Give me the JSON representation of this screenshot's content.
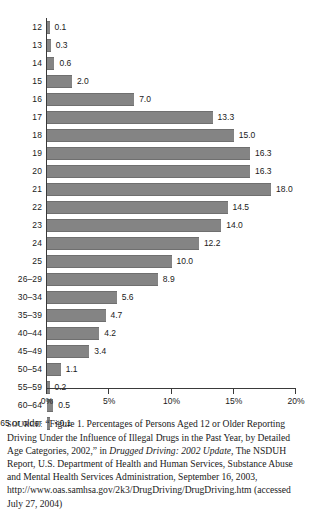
{
  "chart_data": {
    "type": "bar",
    "orientation": "horizontal",
    "title": "",
    "xlabel": "",
    "ylabel": "",
    "xlim": [
      0,
      20
    ],
    "grid": false,
    "legend": false,
    "axis_tick_labels": [
      "0%",
      "5%",
      "10%",
      "15%",
      "20%"
    ],
    "axis_tick_values": [
      0,
      5,
      10,
      15,
      20
    ],
    "categories": [
      "12",
      "13",
      "14",
      "15",
      "16",
      "17",
      "18",
      "19",
      "20",
      "21",
      "22",
      "23",
      "24",
      "25",
      "26–29",
      "30–34",
      "35–39",
      "40–44",
      "45–49",
      "50–54",
      "55–59",
      "60–64",
      "65 or older"
    ],
    "values": [
      0.1,
      0.3,
      0.6,
      2.0,
      7.0,
      13.3,
      15.0,
      16.3,
      16.3,
      18.0,
      14.5,
      14.0,
      12.2,
      10.0,
      8.9,
      5.6,
      4.7,
      4.2,
      3.4,
      1.1,
      0.2,
      0.5,
      0.1
    ],
    "value_labels": [
      "0.1",
      "0.3",
      "0.6",
      "2.0",
      "7.0",
      "13.3",
      "15.0",
      "16.3",
      "16.3",
      "18.0",
      "14.5",
      "14.0",
      "12.2",
      "10.0",
      "8.9",
      "5.6",
      "4.7",
      "4.2",
      "3.4",
      "1.1",
      "0.2",
      "0.5",
      "<0.1"
    ],
    "bar_color": "#848484"
  },
  "source": {
    "label": "SOURCE:",
    "line1": "“Figure 1. Percentages of Persons Aged 12 or Older Reporting Driving Under the Influence of Illegal Drugs in the Past Year, by Detailed Age Categories, 2002,” in ",
    "italic1": "Drugged Driving: 2002 Update,",
    "line2": " The NSDUH Report, U.S. Department of Health and Human Services, Substance Abuse and Mental Health Services Administration, September 16, 2003, http://www.oas.samhsa.gov/2k3/DrugDriving/DrugDriving.htm (accessed July 27, 2004)"
  }
}
